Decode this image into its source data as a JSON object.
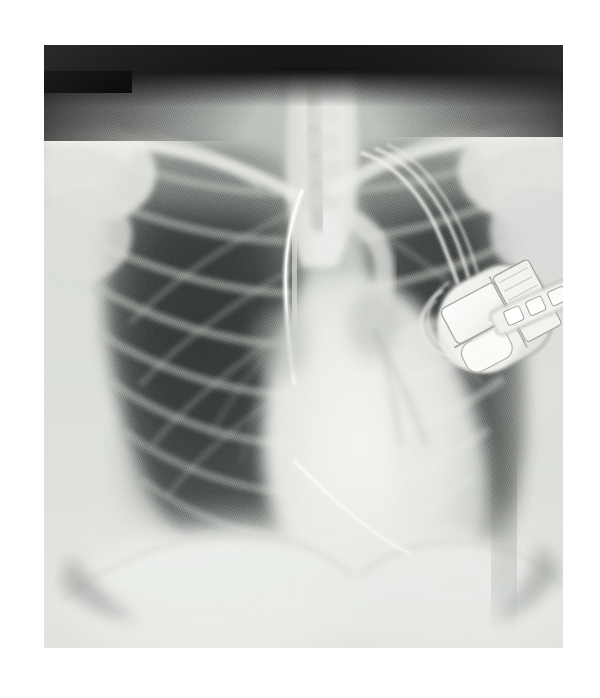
{
  "document": {
    "kind": "medical-radiograph",
    "modality": "X-ray",
    "view": "frontal chest (PA/AP)",
    "background_color": "#ffffff",
    "caption": "",
    "overlay_text": ""
  },
  "image": {
    "frame": {
      "left_px": 44,
      "top_px": 45,
      "width_px": 519,
      "height_px": 603,
      "border": "none",
      "margin_color": "#ffffff"
    },
    "collimation": {
      "top_band": true,
      "top_band_color": "#1a1a1a",
      "corner_block_color": "#050505",
      "corner_block_position": "top-left"
    },
    "tone": {
      "lung_dark": "#4d5150",
      "lung_darkest": "#313534",
      "soft_tissue": "#c9cbc7",
      "mediastinum": "#e8e9e4",
      "bone": "#dfe0dc",
      "metal_bright": "#fbfbf7",
      "background_exposed": "#161616"
    }
  },
  "anatomy": {
    "structures": [
      {
        "name": "right-clavicle",
        "side": "viewer-left",
        "visible": true
      },
      {
        "name": "left-clavicle",
        "side": "viewer-right",
        "visible": true
      },
      {
        "name": "right-shoulder-humeral-head",
        "side": "viewer-left",
        "visible": true
      },
      {
        "name": "left-shoulder-humeral-head",
        "side": "viewer-right",
        "visible": true
      },
      {
        "name": "trachea",
        "side": "midline",
        "visible": true
      },
      {
        "name": "thoracic-spine",
        "side": "midline",
        "visible": true
      },
      {
        "name": "right-lung-field",
        "side": "viewer-left",
        "visible": true,
        "aeration": "well-aerated, hyperlucent"
      },
      {
        "name": "left-lung-field",
        "side": "viewer-right",
        "visible": true,
        "aeration": "aerated, partially obscured by device"
      },
      {
        "name": "rib-cage",
        "side": "bilateral",
        "visible": true,
        "posterior_rib_pairs": 9
      },
      {
        "name": "cardiac-silhouette",
        "side": "midline-left",
        "visible": true,
        "appearance": "enlarged, radiopaque"
      },
      {
        "name": "aortic-arch",
        "side": "midline",
        "visible": true
      },
      {
        "name": "right-hemidiaphragm",
        "side": "viewer-left",
        "visible": true
      },
      {
        "name": "left-hemidiaphragm",
        "side": "viewer-right",
        "visible": true
      },
      {
        "name": "right-costophrenic-angle",
        "side": "viewer-left",
        "visible": true
      },
      {
        "name": "left-costophrenic-angle",
        "side": "viewer-right",
        "visible": true
      }
    ]
  },
  "devices": {
    "generator": {
      "name": "pacemaker-generator",
      "label": "implanted pulse generator",
      "position": "left pectoral region (viewer right upper-mid)",
      "center_px": [
        494,
        315
      ],
      "width_px": 108,
      "height_px": 112,
      "rotation_deg": -28,
      "can_color": "#eceee9",
      "battery_color": "#fdfdfa",
      "circuit_color": "#f4f4ee",
      "outline_color": "#8f9390",
      "parts": [
        "titanium can",
        "battery mass",
        "circuit board",
        "connector header",
        "lead set screws"
      ]
    },
    "leads": [
      {
        "name": "superior-lead-loop-outer",
        "description": "lead wire looping from header toward left subclavian vein",
        "brightness": "high"
      },
      {
        "name": "superior-lead-loop-inner",
        "description": "second lead wire paralleling the first",
        "brightness": "high"
      },
      {
        "name": "header-slack-loop",
        "description": "redundant slack coil beside the generator header",
        "brightness": "medium-high"
      },
      {
        "name": "mediastinal-lead",
        "description": "bright curved lead descending through the mediastinum",
        "brightness": "very-high"
      },
      {
        "name": "inferior-diagonal-lead",
        "description": "lead crossing the cardiac shadow toward the lower right",
        "brightness": "medium-high"
      }
    ]
  }
}
